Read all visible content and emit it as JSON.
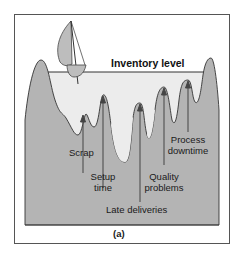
{
  "figure": {
    "title": "Inventory level",
    "caption": "(a)",
    "labels": {
      "scrap": "Scrap",
      "setup_line1": "Setup",
      "setup_line2": "time",
      "late": "Late deliveries",
      "quality_line1": "Quality",
      "quality_line2": "problems",
      "process_line1": "Process",
      "process_line2": "downtime"
    },
    "colors": {
      "frame": "#555555",
      "water": "#eeeeee",
      "rock": "#b4b4b4",
      "rock_outline": "#333333",
      "arrow": "#444444",
      "sail": "#bdbdbd"
    }
  }
}
